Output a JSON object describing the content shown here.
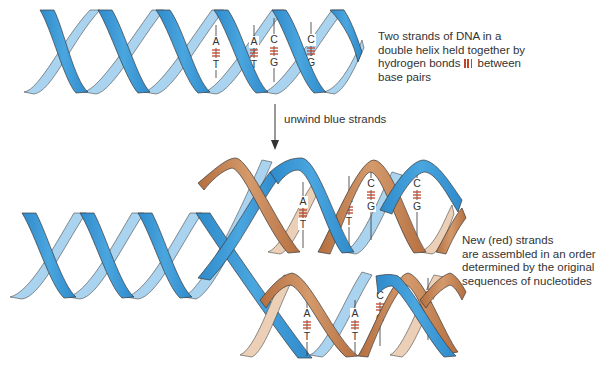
{
  "diagram": {
    "colors": {
      "parental_strand_front": "#3d9ad6",
      "parental_strand_back": "#a9d3ef",
      "new_strand_front": "#c98a5c",
      "new_strand_back": "#ebcfb6",
      "hydrogen_bond": "#c0452b",
      "outline": "#3a3a3a"
    },
    "captions": {
      "top_line1": "Two strands of DNA in a",
      "top_line2": "double helix held together by",
      "top_line3a": "hydrogen bonds",
      "top_line3b": "between",
      "top_line4": "base pairs",
      "arrow_label": "unwind blue strands",
      "bottom_line1": "New (red) strands",
      "bottom_line2": "are assembled in an order",
      "bottom_line3": "determined by the original",
      "bottom_line4": "sequences of nucleotides"
    },
    "top_helix": {
      "base_pairs": [
        {
          "top": "A",
          "bottom": "T"
        },
        {
          "top": "A",
          "bottom": "T"
        },
        {
          "top": "C",
          "bottom": "G"
        },
        {
          "top": "C",
          "bottom": "G"
        }
      ]
    },
    "bottom_upper_helix": {
      "base_pairs": [
        {
          "top": "A",
          "bottom": "T"
        },
        {
          "top": "A",
          "bottom": "T"
        },
        {
          "top": "C",
          "bottom": "G"
        },
        {
          "top": "C",
          "bottom": "G"
        }
      ]
    },
    "bottom_lower_helix": {
      "base_pairs": [
        {
          "top": "A",
          "bottom": "T"
        },
        {
          "top": "A",
          "bottom": "T"
        },
        {
          "top": "C",
          "bottom": "G"
        },
        {
          "top": "C",
          "bottom": "G"
        }
      ]
    }
  }
}
